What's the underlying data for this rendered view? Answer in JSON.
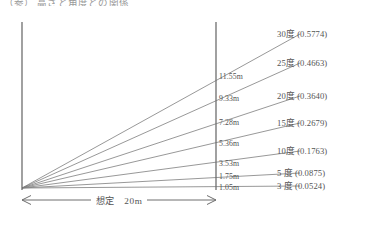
{
  "caption": "（参） 高さと角度との関係",
  "bottom_note": "",
  "diagram": {
    "baseline_label": "想定　20m",
    "baseline_distance_m": 20,
    "origin": {
      "x": 22,
      "y": 188
    },
    "left_axis": {
      "x": 22,
      "y_top": 22,
      "y_bottom": 190
    },
    "right_axis": {
      "x": 216,
      "y_top": 22,
      "y_bottom": 190
    },
    "dimension_line_y": 200,
    "dimension_x_start": 22,
    "dimension_x_end": 216,
    "colors": {
      "line": "#7d7d7d",
      "axis": "#6e6e6e",
      "text": "#535353",
      "background": "#ffffff"
    }
  },
  "chart_data": {
    "type": "line",
    "title": "（参） 高さと角度との関係",
    "xlabel": "想定　20m",
    "ylabel": "",
    "distance_m": 20,
    "series": [
      {
        "name": "30度 (0.5774)",
        "angle_deg": 30,
        "tangent": 0.5774,
        "height_m": 11.55,
        "height_label": "11.55m",
        "angle_label": "30度 (0.5774)",
        "label_y": 33,
        "height_label_y": 78,
        "ray_end_x": 300,
        "ray_end_y": 34
      },
      {
        "name": "25度 (0.4663)",
        "angle_deg": 25,
        "tangent": 0.4663,
        "height_m": 9.33,
        "height_label": "9.33m",
        "angle_label": "25度 (0.4663)",
        "label_y": 62,
        "height_label_y": 100,
        "ray_end_x": 300,
        "ray_end_y": 63
      },
      {
        "name": "20度 (0.3640)",
        "angle_deg": 20,
        "tangent": 0.364,
        "height_m": 7.28,
        "height_label": "7.28m",
        "angle_label": "20度 (0.3640)",
        "label_y": 95,
        "height_label_y": 124,
        "ray_end_x": 300,
        "ray_end_y": 96
      },
      {
        "name": "15度 (0.2679)",
        "angle_deg": 15,
        "tangent": 0.2679,
        "height_m": 5.36,
        "height_label": "5.36m",
        "angle_label": "15度 (0.2679)",
        "label_y": 122,
        "height_label_y": 145,
        "ray_end_x": 300,
        "ray_end_y": 123
      },
      {
        "name": "10度 (0.1763)",
        "angle_deg": 10,
        "tangent": 0.1763,
        "height_m": 3.53,
        "height_label": "3.53m",
        "angle_label": "10度 (0.1763)",
        "label_y": 150,
        "height_label_y": 165,
        "ray_end_x": 300,
        "ray_end_y": 151
      },
      {
        "name": "5 度 (0.0875)",
        "angle_deg": 5,
        "tangent": 0.0875,
        "height_m": 1.75,
        "height_label": "1.75m",
        "angle_label": "5 度 (0.0875)",
        "label_y": 172,
        "height_label_y": 178,
        "ray_end_x": 300,
        "ray_end_y": 173
      },
      {
        "name": "3 度 (0.0524)",
        "angle_deg": 3,
        "tangent": 0.0524,
        "height_m": 1.05,
        "height_label": "1.05m",
        "angle_label": "3 度 (0.0524)",
        "label_y": 185,
        "height_label_y": 189,
        "ray_end_x": 300,
        "ray_end_y": 186
      }
    ],
    "grid": false,
    "legend_position": "right"
  }
}
